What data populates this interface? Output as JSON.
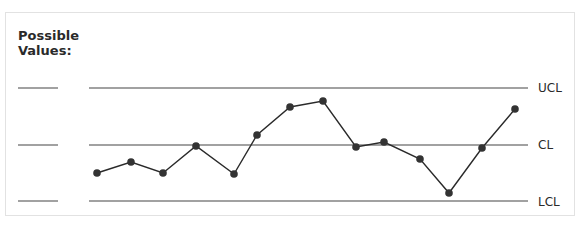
{
  "chart_data": {
    "type": "line",
    "title": "",
    "ylabel": "Possible Values:",
    "xlabel": "",
    "control_lines": [
      {
        "name": "UCL",
        "y": 88
      },
      {
        "name": "CL",
        "y": 145
      },
      {
        "name": "LCL",
        "y": 201
      }
    ],
    "series": [
      {
        "name": "values",
        "points_px": [
          [
            97,
            173
          ],
          [
            131,
            162
          ],
          [
            163,
            173
          ],
          [
            196,
            146
          ],
          [
            234,
            174
          ],
          [
            257,
            135
          ],
          [
            290,
            107
          ],
          [
            323,
            101
          ],
          [
            356,
            147
          ],
          [
            384,
            142
          ],
          [
            420,
            159
          ],
          [
            449,
            193
          ],
          [
            482,
            148
          ],
          [
            515,
            109
          ]
        ]
      }
    ],
    "grid": false,
    "legend": null
  },
  "labels": {
    "ylabel_line1": "Possible",
    "ylabel_line2": "Values:",
    "ucl": "UCL",
    "cl": "CL",
    "lcl": "LCL"
  },
  "colors": {
    "line": "#2a2a2a",
    "point": "#333333",
    "frame": "#e2e2e2"
  }
}
